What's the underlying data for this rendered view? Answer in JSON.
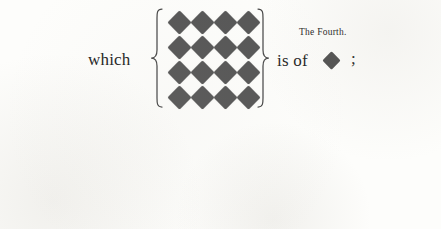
{
  "document": {
    "kind": "figurate-number-demonstration",
    "background_color": "#fdfdfb",
    "ink_color": "#242424"
  },
  "upper_row": {
    "lead_word": "which",
    "caption": "The Fourth.",
    "relation": "is of",
    "terminator": ";",
    "group": {
      "shape": "diamond",
      "rows": 4,
      "columns": 4,
      "count": 16,
      "fill_color": "#565656"
    },
    "single_shape": {
      "shape": "diamond",
      "fill_color": "#4f4f4f"
    }
  },
  "lower_row": {
    "lead_word": "becaufe",
    "relation_first": "contains",
    "relation_second": "contains",
    "group_large": {
      "shape": "square",
      "rows": 4,
      "columns": 4,
      "count": 16,
      "fill_color": "#565656"
    },
    "group_cross": {
      "shape": "square",
      "arrangement": "cross",
      "count": 4,
      "positions": [
        "top",
        "left",
        "right",
        "bottom"
      ],
      "fill_color": "#b6b6b6"
    },
    "single_shape": {
      "shape": "square",
      "fill_color": "#4a4a4a"
    }
  },
  "braces": {
    "stroke_color": "#494949",
    "tall_height": 100,
    "medium_height": 88,
    "small_height": 64
  }
}
